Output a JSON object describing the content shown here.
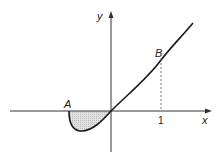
{
  "diagram": {
    "type": "function-graph",
    "axes": {
      "x_label": "x",
      "y_label": "y"
    },
    "tick_labels": {
      "x_one": "1"
    },
    "points": {
      "A": {
        "label": "A",
        "description": "x-intercept left of origin, start of curve"
      },
      "B": {
        "label": "B",
        "description": "point on curve above x = 1"
      }
    },
    "curve": "passes through A, dips below x-axis, through origin, rises to B and beyond",
    "shaded_region": "area between curve and x-axis from A to origin (below x-axis)",
    "dashed_line": "vertical from B down to x = 1"
  },
  "colors": {
    "stroke": "#1a1a1a",
    "shade": "#cfcfcf",
    "axis": "#333333"
  }
}
